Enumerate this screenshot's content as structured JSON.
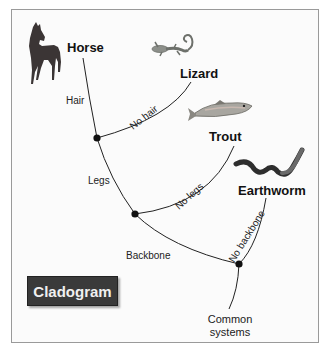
{
  "diagram": {
    "title": "Cladogram",
    "taxa": [
      {
        "name": "Horse",
        "image": "horse-image"
      },
      {
        "name": "Lizard",
        "image": "lizard-image"
      },
      {
        "name": "Trout",
        "image": "trout-image"
      },
      {
        "name": "Earthworm",
        "image": "earthworm-image"
      }
    ],
    "traits": {
      "hair": "Hair",
      "no_hair": "No hair",
      "legs": "Legs",
      "no_legs": "No legs",
      "backbone": "Backbone",
      "no_backbone": "No backbone"
    },
    "root": {
      "line1": "Common",
      "line2": "systems"
    },
    "colors": {
      "line": "#222222",
      "node": "#111111",
      "title_bg": "#3a3a3a",
      "title_text": "#f0f0f0"
    }
  }
}
